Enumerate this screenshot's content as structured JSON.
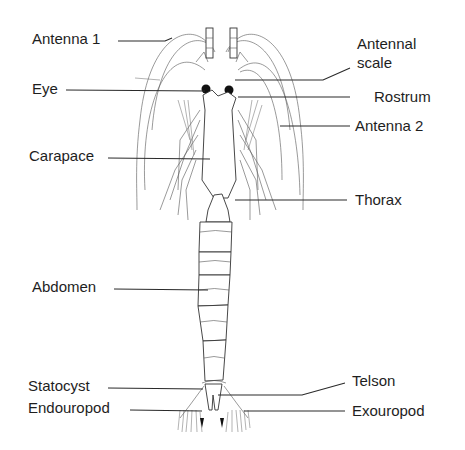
{
  "diagram": {
    "labels": {
      "antenna1": "Antenna 1",
      "eye": "Eye",
      "carapace": "Carapace",
      "abdomen": "Abdomen",
      "statocyst": "Statocyst",
      "endouropod": "Endouropod",
      "antennal_scale_line1": "Antennal",
      "antennal_scale_line2": "scale",
      "rostrum": "Rostrum",
      "antenna2": "Antenna 2",
      "thorax": "Thorax",
      "telson": "Telson",
      "exouropod": "Exouropod"
    },
    "colors": {
      "background": "#ffffff",
      "ink": "#1e1e1e"
    }
  }
}
